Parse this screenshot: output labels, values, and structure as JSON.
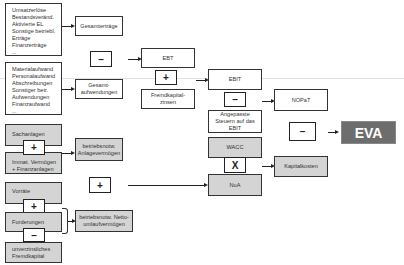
{
  "diagram": {
    "revenue_items": {
      "text": "Umsatzerlöse\nBestandsveränd.\nAktivierte EL\nSonstige betriebl.\nErträge\nFinanzerträge\n..."
    },
    "expense_items": {
      "text": "Materialaufwand\nPersonalaufwand\nAbschreibungen\nSonstiger betr.\nAufwendungen\nFinanzaufwand\n..."
    },
    "gesamtertraege": "Gesamterträge",
    "gesamtaufwendungen": "Gesamt-\naufwendungen",
    "ebt": "EBT",
    "fremdkapitalzinsen": "Fremdkapital-\nzinsen",
    "ebit": "EBIT",
    "angepasste_steuern": "Angepasste\nSteuern auf das\nEBIT",
    "nopat": "NOPaT",
    "wacc": "WACC",
    "nua": "NuA",
    "kapitalkosten": "Kapitalkosten",
    "eva": "EVA",
    "sachanlagen": "Sachanlagen",
    "immat_vermoegen": "Immat. Vermögen\n+ Finanzanlagen",
    "betriebsnotw_anlagevermoegen": "betriebsnotw.\nAnlagevermögen",
    "vorraete": "Vorräte",
    "forderungen": "Forderungen",
    "unverzinsliches_fk": "unverzinsliches\nFremdkapital",
    "betriebsnotw_netto_umlauf": "betriebsnotw. Netto-\numlaufvermögen",
    "operators": {
      "minus": "–",
      "plus": "+",
      "times": "X"
    },
    "colors": {
      "gray_box": "#d4d4d4",
      "eva_box": "#6d6d6d",
      "border": "#333333"
    }
  }
}
